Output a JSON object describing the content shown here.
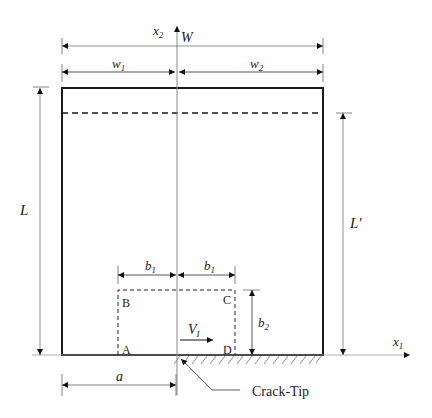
{
  "diagram": {
    "labels": {
      "x2_axis": "x",
      "x2_sub": "2",
      "x1_axis": "x",
      "x1_sub": "1",
      "width_total": "W",
      "w1": "w",
      "w1_sub": "1",
      "w2": "w",
      "w2_sub": "2",
      "length": "L",
      "length_prime": "L′",
      "b1_left": "b",
      "b1_left_sub": "1",
      "b1_right": "b",
      "b1_right_sub": "1",
      "b2": "b",
      "b2_sub": "2",
      "velocity": "V",
      "velocity_sub": "I",
      "crack_length": "a",
      "corner_A": "A",
      "corner_B": "B",
      "corner_C": "C",
      "corner_D": "D",
      "crack_tip": "Crack-Tip"
    },
    "colors": {
      "outline": "#1a1a1a",
      "dim": "#555555",
      "axis": "#888888"
    }
  }
}
